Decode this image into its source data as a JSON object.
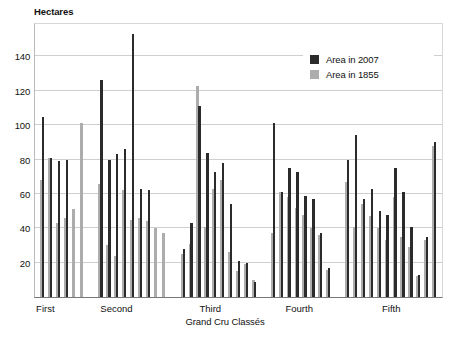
{
  "chart_data": {
    "type": "bar",
    "title": "",
    "ylabel": "Hectares",
    "xlabel": "Grand Cru Classés",
    "ylim": [
      0,
      160
    ],
    "yticks": [
      20,
      40,
      60,
      80,
      100,
      120,
      140
    ],
    "grid": true,
    "legend_position": "top-right",
    "legend": [
      "Area in 2007",
      "Area in 1855"
    ],
    "colors": {
      "series_2007": "#2b2b2b",
      "series_1855": "#adadad",
      "grid": "#cfcfcf",
      "axis": "#777777"
    },
    "group_labels": [
      "First",
      "Second",
      "Third",
      "Fourth",
      "Fifth"
    ],
    "series": [
      {
        "name": "Area in 2007",
        "color": "#2b2b2b",
        "values": [
          105,
          81,
          79,
          80,
          126,
          80,
          83,
          86,
          153,
          63,
          62,
          28,
          43,
          111,
          84,
          73,
          78,
          54,
          21,
          20,
          9,
          101,
          61,
          75,
          73,
          59,
          57,
          37,
          80,
          94,
          57,
          63,
          50,
          48,
          75,
          61,
          41,
          13,
          35,
          90
        ]
      },
      {
        "name": "Area in 1855",
        "color": "#adadad",
        "values": [
          68,
          81,
          43,
          46,
          52,
          51,
          65,
          30,
          24,
          62,
          45,
          46,
          44,
          40,
          37,
          25,
          31,
          123,
          41,
          63,
          68,
          54,
          26,
          15,
          19,
          37,
          61,
          58,
          52,
          48,
          40,
          36,
          67,
          41,
          54,
          47,
          40,
          33,
          58,
          35,
          29,
          12,
          33,
          88
        ]
      }
    ]
  },
  "groups": [
    {
      "label": "First",
      "bars": [
        {
          "a2007": 105,
          "a1855": 68
        },
        {
          "a2007": 81,
          "a1855": 81
        },
        {
          "a2007": 79,
          "a1855": 43
        },
        {
          "a2007": 80,
          "a1855": 46
        },
        {
          "a2007": 0,
          "a1855": 51
        },
        {
          "a2007": 0,
          "a1855": 101
        }
      ]
    },
    {
      "label": "Second",
      "bars": [
        {
          "a2007": 126,
          "a1855": 66
        },
        {
          "a2007": 80,
          "a1855": 30
        },
        {
          "a2007": 83,
          "a1855": 24
        },
        {
          "a2007": 86,
          "a1855": 62
        },
        {
          "a2007": 153,
          "a1855": 45
        },
        {
          "a2007": 63,
          "a1855": 46
        },
        {
          "a2007": 62,
          "a1855": 44
        },
        {
          "a2007": 0,
          "a1855": 40
        },
        {
          "a2007": 0,
          "a1855": 37
        }
      ]
    },
    {
      "label": "Third",
      "bars": [
        {
          "a2007": 28,
          "a1855": 25
        },
        {
          "a2007": 43,
          "a1855": 31
        },
        {
          "a2007": 111,
          "a1855": 123
        },
        {
          "a2007": 84,
          "a1855": 41
        },
        {
          "a2007": 73,
          "a1855": 63
        },
        {
          "a2007": 78,
          "a1855": 68
        },
        {
          "a2007": 54,
          "a1855": 26
        },
        {
          "a2007": 21,
          "a1855": 15
        },
        {
          "a2007": 20,
          "a1855": 19
        },
        {
          "a2007": 9,
          "a1855": 10
        }
      ]
    },
    {
      "label": "Fourth",
      "bars": [
        {
          "a2007": 101,
          "a1855": 37
        },
        {
          "a2007": 61,
          "a1855": 61
        },
        {
          "a2007": 75,
          "a1855": 58
        },
        {
          "a2007": 73,
          "a1855": 52
        },
        {
          "a2007": 59,
          "a1855": 48
        },
        {
          "a2007": 57,
          "a1855": 40
        },
        {
          "a2007": 37,
          "a1855": 36
        },
        {
          "a2007": 17,
          "a1855": 16
        }
      ]
    },
    {
      "label": "Fifth",
      "bars": [
        {
          "a2007": 80,
          "a1855": 67
        },
        {
          "a2007": 94,
          "a1855": 41
        },
        {
          "a2007": 57,
          "a1855": 54
        },
        {
          "a2007": 63,
          "a1855": 47
        },
        {
          "a2007": 50,
          "a1855": 40
        },
        {
          "a2007": 48,
          "a1855": 33
        },
        {
          "a2007": 75,
          "a1855": 58
        },
        {
          "a2007": 61,
          "a1855": 35
        },
        {
          "a2007": 41,
          "a1855": 29
        },
        {
          "a2007": 13,
          "a1855": 12
        },
        {
          "a2007": 35,
          "a1855": 33
        },
        {
          "a2007": 90,
          "a1855": 88
        }
      ]
    }
  ],
  "legend": {
    "items": [
      {
        "label": "Area in 2007",
        "color": "#2b2b2b"
      },
      {
        "label": "Area in 1855",
        "color": "#adadad"
      }
    ]
  },
  "axes": {
    "y_title": "Hectares",
    "x_title": "Grand Cru Classés",
    "y_ticks": [
      "20",
      "40",
      "60",
      "80",
      "100",
      "120",
      "140"
    ]
  }
}
